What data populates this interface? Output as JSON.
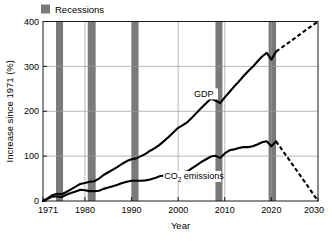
{
  "legend": {
    "position": "top-left-outside",
    "entries": [
      {
        "label": "Recessions",
        "swatch": "#7a7a7a",
        "type": "band"
      }
    ]
  },
  "colors": {
    "recession_band": "#7a7a7a",
    "line": "#000000",
    "grid": "#9a9a9a",
    "axis": "#1a1a1a",
    "background": "#ffffff"
  },
  "chart_data": {
    "type": "line",
    "title": "",
    "subtitle": "",
    "xlabel": "Year",
    "ylabel": "Increase since 1971 (%)",
    "xlim": [
      1971,
      2030
    ],
    "ylim": [
      0,
      400
    ],
    "xticks": [
      1971,
      1980,
      1990,
      2000,
      2010,
      2020,
      2030
    ],
    "xticklabels": [
      "1971",
      "1980",
      "1990",
      "2000",
      "2010",
      "2020",
      "2030"
    ],
    "yticks": [
      0,
      100,
      200,
      300,
      400
    ],
    "yticklabels": [
      "0",
      "100",
      "200",
      "300",
      "400"
    ],
    "grid": "horizontal-and-vertical",
    "legend_position": "above-plot-left",
    "annotations": [
      {
        "text": "GDP",
        "x": 2003.4,
        "y": 232,
        "name": "gdp-series-label"
      },
      {
        "text": "CO2 emissions",
        "sub": "2",
        "x": 1997.0,
        "y": 48,
        "name": "co2-series-label"
      }
    ],
    "bands": [
      {
        "name": "recession-1974",
        "x0": 1973.8,
        "x1": 1975.3
      },
      {
        "name": "recession-1981",
        "x0": 1980.6,
        "x1": 1982.3
      },
      {
        "name": "recession-1990",
        "x0": 1990.0,
        "x1": 1991.5
      },
      {
        "name": "recession-2008",
        "x0": 2008.0,
        "x1": 2009.5
      },
      {
        "name": "recession-2020",
        "x0": 2019.4,
        "x1": 2021.0
      }
    ],
    "series": [
      {
        "name": "GDP",
        "style": "solid",
        "x": [
          1971,
          1972,
          1973,
          1974,
          1975,
          1976,
          1977,
          1978,
          1979,
          1980,
          1981,
          1982,
          1983,
          1984,
          1985,
          1986,
          1987,
          1988,
          1989,
          1990,
          1991,
          1992,
          1993,
          1994,
          1995,
          1996,
          1997,
          1998,
          1999,
          2000,
          2001,
          2002,
          2003,
          2004,
          2005,
          2006,
          2007,
          2008,
          2009,
          2010,
          2011,
          2012,
          2013,
          2014,
          2015,
          2016,
          2017,
          2018,
          2019,
          2020,
          2021
        ],
        "values": [
          0,
          6,
          13,
          16,
          15,
          20,
          26,
          32,
          38,
          40,
          43,
          44,
          50,
          58,
          64,
          70,
          76,
          83,
          89,
          93,
          95,
          100,
          105,
          112,
          118,
          125,
          134,
          143,
          153,
          163,
          169,
          176,
          186,
          197,
          208,
          218,
          228,
          224,
          218,
          231,
          243,
          255,
          266,
          278,
          289,
          299,
          311,
          322,
          330,
          315,
          333
        ]
      },
      {
        "name": "GDP projection",
        "style": "dashed",
        "x": [
          2021,
          2024,
          2027,
          2030
        ],
        "values": [
          333,
          355,
          378,
          400
        ]
      },
      {
        "name": "CO2 emissions",
        "style": "solid",
        "x": [
          1971,
          1972,
          1973,
          1974,
          1975,
          1976,
          1977,
          1978,
          1979,
          1980,
          1981,
          1982,
          1983,
          1984,
          1985,
          1986,
          1987,
          1988,
          1989,
          1990,
          1991,
          1992,
          1993,
          1994,
          1995,
          1996,
          1997,
          1998,
          1999,
          2000,
          2001,
          2002,
          2003,
          2004,
          2005,
          2006,
          2007,
          2008,
          2009,
          2010,
          2011,
          2012,
          2013,
          2014,
          2015,
          2016,
          2017,
          2018,
          2019,
          2020,
          2021
        ],
        "values": [
          0,
          5,
          10,
          10,
          9,
          14,
          18,
          21,
          25,
          24,
          22,
          22,
          23,
          27,
          30,
          33,
          36,
          40,
          43,
          45,
          45,
          45,
          46,
          48,
          51,
          55,
          57,
          57,
          58,
          62,
          64,
          66,
          73,
          80,
          87,
          93,
          99,
          101,
          96,
          106,
          113,
          115,
          118,
          120,
          120,
          122,
          126,
          131,
          133,
          122,
          133
        ]
      },
      {
        "name": "CO2 emissions projection",
        "style": "dashed",
        "x": [
          2021,
          2024,
          2027,
          2030
        ],
        "values": [
          133,
          89,
          45,
          0
        ]
      }
    ]
  }
}
